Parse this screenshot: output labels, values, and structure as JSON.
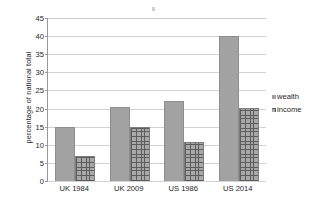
{
  "chart_data": {
    "type": "bar",
    "title": "",
    "xlabel": "",
    "ylabel": "percentage of national total",
    "categories": [
      "UK 1984",
      "UK 2009",
      "US 1986",
      "US 2014"
    ],
    "series": [
      {
        "name": "wealth",
        "values": [
          15,
          20.5,
          22,
          40
        ],
        "color": "#a2a2a2"
      },
      {
        "name": "income",
        "values": [
          7,
          15,
          10.7,
          20.2
        ],
        "color": "#a8a8a8"
      }
    ],
    "ylim": [
      0,
      45
    ],
    "ytick_step": 5,
    "yticks": [
      "0",
      "5",
      "10",
      "15",
      "20",
      "25",
      "30",
      "35",
      "40",
      "45"
    ],
    "grid": true,
    "legend_position": "right",
    "legend": [
      "wealth",
      "income"
    ]
  },
  "legend": {
    "items": [
      {
        "label": "wealth",
        "marker": "solid-gray-square-icon"
      },
      {
        "label": "income",
        "marker": "crosshatch-square-icon"
      }
    ]
  }
}
